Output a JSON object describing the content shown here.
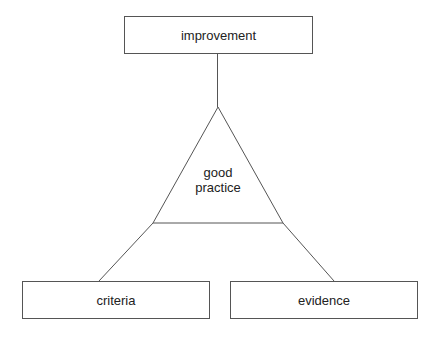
{
  "diagram": {
    "top_node": {
      "label": "improvement"
    },
    "center_node": {
      "line1": "good",
      "line2": "practice",
      "shape": "triangle"
    },
    "left_node": {
      "label": "criteria"
    },
    "right_node": {
      "label": "evidence"
    },
    "colors": {
      "stroke": "#555555",
      "text": "#222222",
      "background": "#ffffff"
    }
  }
}
